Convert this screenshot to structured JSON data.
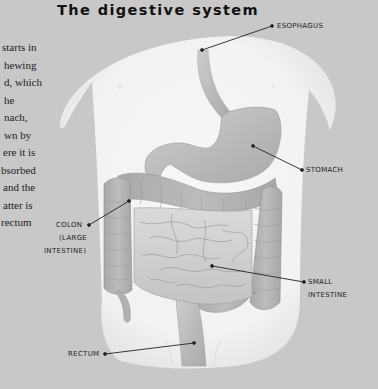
{
  "title": "The digestive system",
  "paragraph": {
    "lines": [
      "starts in",
      "hewing",
      "d, which",
      "he",
      "nach,",
      "wn by",
      "ere it is",
      "bsorbed",
      "and the",
      "atter is",
      "rectum"
    ]
  },
  "labels": {
    "esophagus": "ESOPHAGUS",
    "stomach": "STOMACH",
    "colon_1": "COLON",
    "colon_2": "(LARGE",
    "colon_3": "INTESTINE)",
    "small_1": "SMALL",
    "small_2": "INTESTINE",
    "rectum": "RECTUM"
  },
  "colors": {
    "background": "#c8c8c8",
    "body": "#f4f4f4",
    "organ": "#b9b9b9",
    "organ_dark": "#9e9e9e",
    "leader": "#222222"
  }
}
